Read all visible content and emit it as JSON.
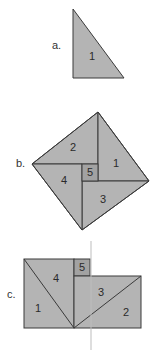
{
  "colors": {
    "fill": "#b4b4b4",
    "fill_small_square": "#a2a2a2",
    "stroke": "#3a3a3a",
    "guide_line": "#bdbdbd",
    "background": "#ffffff"
  },
  "figure_a": {
    "label": "a.",
    "pieces": [
      {
        "number": "1"
      }
    ]
  },
  "figure_b": {
    "label": "b.",
    "pieces": [
      {
        "number": "1"
      },
      {
        "number": "2"
      },
      {
        "number": "3"
      },
      {
        "number": "4"
      },
      {
        "number": "5"
      }
    ]
  },
  "figure_c": {
    "label": "c.",
    "pieces": [
      {
        "number": "1"
      },
      {
        "number": "2"
      },
      {
        "number": "3"
      },
      {
        "number": "4"
      },
      {
        "number": "5"
      }
    ],
    "has_vertical_guide_line": true
  }
}
